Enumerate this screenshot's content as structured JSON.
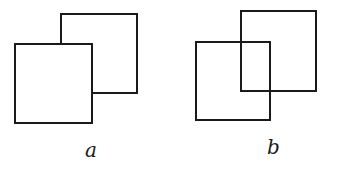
{
  "figures": [
    {
      "id": "a",
      "label": "a",
      "description": "Front square occludes back square",
      "back_square": {
        "x": 61,
        "y": 14,
        "w": 76,
        "h": 79
      },
      "front_square": {
        "x": 15,
        "y": 44,
        "w": 77,
        "h": 79
      },
      "label_pos": {
        "x": 85,
        "y": 140
      }
    },
    {
      "id": "b",
      "label": "b",
      "description": "Two transparent overlapping squares",
      "square_1": {
        "x": 196,
        "y": 42,
        "w": 74,
        "h": 78
      },
      "square_2": {
        "x": 241,
        "y": 11,
        "w": 75,
        "h": 80
      },
      "label_pos": {
        "x": 267,
        "y": 137
      }
    }
  ],
  "colors": {
    "stroke": "#1a1a1a",
    "background": "#ffffff"
  }
}
